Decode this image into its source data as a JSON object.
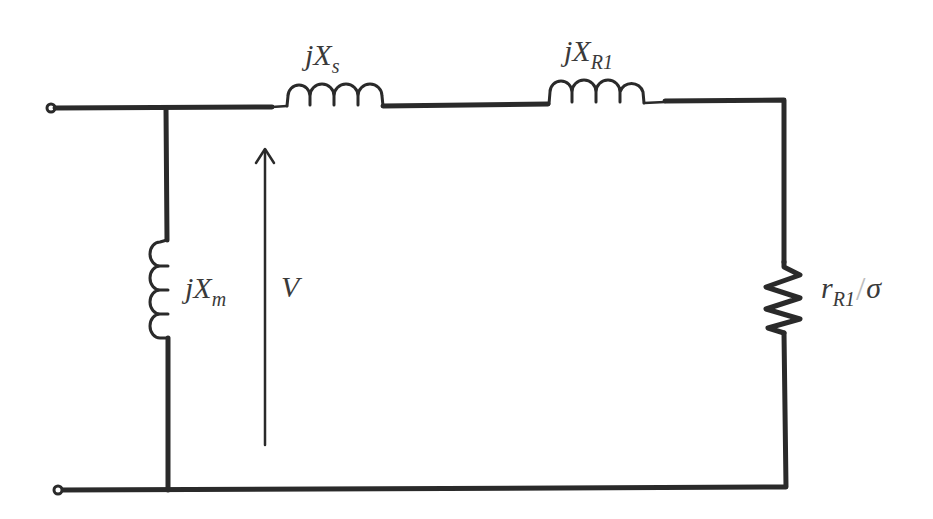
{
  "diagram": {
    "type": "equivalent-circuit",
    "colors": {
      "wire": "#2a2a2a",
      "label": "#3a3a3a",
      "background": "#ffffff"
    },
    "labels": {
      "jxs": {
        "prefix": "jX",
        "sub": "s"
      },
      "jxr1": {
        "prefix": "jX",
        "sub": "R1"
      },
      "jxm": {
        "prefix": "jX",
        "sub": "m"
      },
      "v": {
        "text": "V"
      },
      "rr1": {
        "prefix": "r",
        "sub": "R1",
        "slash": "/",
        "denominator": "σ"
      }
    },
    "components": [
      {
        "id": "jXs",
        "kind": "inductor",
        "position": "top-series-left"
      },
      {
        "id": "jXR1",
        "kind": "inductor",
        "position": "top-series-right"
      },
      {
        "id": "jXm",
        "kind": "inductor",
        "position": "shunt-left"
      },
      {
        "id": "rR1/σ",
        "kind": "resistor",
        "position": "right-branch"
      },
      {
        "id": "V",
        "kind": "voltage-arrow",
        "direction": "up"
      }
    ],
    "terminals": 2
  }
}
